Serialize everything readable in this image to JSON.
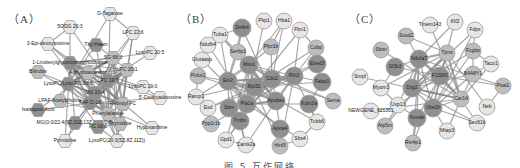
{
  "figure": {
    "caption": "图 5   互作网络"
  },
  "colors": {
    "edge": "#8a8a8a",
    "node_light": "#e6e6e6",
    "node_mid": "#bdbdbd",
    "node_dark": "#8f8f8f",
    "node_stroke": "#9a9a9a",
    "label": "#222222"
  },
  "panels": [
    {
      "id": "A",
      "label": "（A）",
      "node_shape": "hexagon",
      "nodes": [
        {
          "name": "D-Tagatose",
          "x": 110,
          "y": 14,
          "shade": "light"
        },
        {
          "name": "5ODG 20:3",
          "x": 70,
          "y": 27,
          "shade": "light"
        },
        {
          "name": "LPC 22:6",
          "x": 133,
          "y": 33,
          "shade": "light"
        },
        {
          "name": "3-Epi-deoxyinosine",
          "x": 48,
          "y": 44,
          "shade": "light"
        },
        {
          "name": "Thy-Haem",
          "x": 96,
          "y": 45,
          "shade": "dark"
        },
        {
          "name": "LysoPC 20:5",
          "x": 150,
          "y": 53,
          "shade": "light"
        },
        {
          "name": "SG 66:3",
          "x": 113,
          "y": 58,
          "shade": "mid"
        },
        {
          "name": "1-Linoleoylglycerophosphocholine",
          "x": 70,
          "y": 63,
          "shade": "dark"
        },
        {
          "name": "Bilirubin",
          "x": 38,
          "y": 72,
          "shade": "mid"
        },
        {
          "name": "Anhydroaxanthin",
          "x": 88,
          "y": 73,
          "shade": "mid"
        },
        {
          "name": "LPC 20:1",
          "x": 127,
          "y": 70,
          "shade": "mid"
        },
        {
          "name": "LPC 19:0",
          "x": 108,
          "y": 81,
          "shade": "dark"
        },
        {
          "name": "LysoPC/Lyso PC 20:0",
          "x": 68,
          "y": 84,
          "shade": "dark"
        },
        {
          "name": "LysoPC 19:0",
          "x": 143,
          "y": 87,
          "shade": "light"
        },
        {
          "name": "MG 20:4",
          "x": 95,
          "y": 93,
          "shade": "dark"
        },
        {
          "name": "5'-Deoxyadenosine",
          "x": 160,
          "y": 98,
          "shade": "light"
        },
        {
          "name": "LPAF-Acetylcholine",
          "x": 60,
          "y": 101,
          "shade": "mid"
        },
        {
          "name": "PAF C-16",
          "x": 90,
          "y": 103,
          "shade": "dark"
        },
        {
          "name": "Retinoyl PC",
          "x": 123,
          "y": 104,
          "shade": "mid"
        },
        {
          "name": "Isatropoic Acid",
          "x": 38,
          "y": 110,
          "shade": "dark"
        },
        {
          "name": "Phenylalanine",
          "x": 108,
          "y": 114,
          "shade": "mid"
        },
        {
          "name": "MG(0:0/22:4(7Z,10Z,13Z,16Z)/0:0)",
          "x": 75,
          "y": 123,
          "shade": "dark"
        },
        {
          "name": "Thymidine",
          "x": 120,
          "y": 124,
          "shade": "mid"
        },
        {
          "name": "Hypoxanthine",
          "x": 152,
          "y": 128,
          "shade": "light"
        },
        {
          "name": "PC 16:0",
          "x": 98,
          "y": 127,
          "shade": "dark"
        },
        {
          "name": "Pyrroidine",
          "x": 65,
          "y": 141,
          "shade": "light"
        },
        {
          "name": "LysoPC(20:3(5Z,8Z,11Z))",
          "x": 117,
          "y": 141,
          "shade": "light"
        }
      ]
    },
    {
      "id": "B",
      "label": "（B）",
      "node_shape": "circle",
      "nodes": [
        {
          "name": "Defb4",
          "x": 70,
          "y": 28,
          "shade": "dark"
        },
        {
          "name": "Pkp1",
          "x": 92,
          "y": 21,
          "shade": "light"
        },
        {
          "name": "Hba1",
          "x": 112,
          "y": 21,
          "shade": "light"
        },
        {
          "name": "Fbn1",
          "x": 128,
          "y": 30,
          "shade": "light"
        },
        {
          "name": "Tuba1",
          "x": 48,
          "y": 35,
          "shade": "light"
        },
        {
          "name": "Ndufb4",
          "x": 36,
          "y": 45,
          "shade": "light"
        },
        {
          "name": "Pfpr1b",
          "x": 99,
          "y": 47,
          "shade": "mid"
        },
        {
          "name": "Cobp",
          "x": 144,
          "y": 48,
          "shade": "mid"
        },
        {
          "name": "Serbp1",
          "x": 66,
          "y": 52,
          "shade": "mid"
        },
        {
          "name": "Glutaasp",
          "x": 30,
          "y": 60,
          "shade": "light"
        },
        {
          "name": "Msx1",
          "x": 77,
          "y": 65,
          "shade": "dark"
        },
        {
          "name": "Ebed3",
          "x": 145,
          "y": 64,
          "shade": "dark"
        },
        {
          "name": "Pofut1",
          "x": 26,
          "y": 76,
          "shade": "mid"
        },
        {
          "name": "Rln3",
          "x": 122,
          "y": 76,
          "shade": "dark"
        },
        {
          "name": "Cdx2",
          "x": 100,
          "y": 79,
          "shade": "dark"
        },
        {
          "name": "Fabp3",
          "x": 150,
          "y": 82,
          "shade": "dark"
        },
        {
          "name": "Etv2",
          "x": 56,
          "y": 81,
          "shade": "dark"
        },
        {
          "name": "Rpl32",
          "x": 82,
          "y": 87,
          "shade": "dark"
        },
        {
          "name": "Ramp1",
          "x": 24,
          "y": 97,
          "shade": "light"
        },
        {
          "name": "Pla1a",
          "x": 75,
          "y": 104,
          "shade": "dark"
        },
        {
          "name": "Apobec",
          "x": 104,
          "y": 101,
          "shade": "dark"
        },
        {
          "name": "Kdm2a",
          "x": 137,
          "y": 104,
          "shade": "dark"
        },
        {
          "name": "Sema",
          "x": 161,
          "y": 101,
          "shade": "mid"
        },
        {
          "name": "Esd",
          "x": 36,
          "y": 108,
          "shade": "light"
        },
        {
          "name": "Stim",
          "x": 57,
          "y": 108,
          "shade": "dark"
        },
        {
          "name": "Ppp1r1b",
          "x": 39,
          "y": 124,
          "shade": "mid"
        },
        {
          "name": "Tmbn",
          "x": 68,
          "y": 121,
          "shade": "dark"
        },
        {
          "name": "Tubb6",
          "x": 145,
          "y": 122,
          "shade": "light"
        },
        {
          "name": "Apoa4",
          "x": 108,
          "y": 129,
          "shade": "dark"
        },
        {
          "name": "Sbs4",
          "x": 128,
          "y": 139,
          "shade": "light"
        },
        {
          "name": "Gpd1",
          "x": 54,
          "y": 140,
          "shade": "light"
        },
        {
          "name": "Hinf3",
          "x": 108,
          "y": 146,
          "shade": "mid"
        },
        {
          "name": "Camk2a",
          "x": 74,
          "y": 145,
          "shade": "light"
        }
      ]
    },
    {
      "id": "C",
      "label": "（C）",
      "node_shape": "circle",
      "nodes": [
        {
          "name": "Tmem143",
          "x": 87,
          "y": 25,
          "shade": "light"
        },
        {
          "name": "Klf2",
          "x": 112,
          "y": 22,
          "shade": "light"
        },
        {
          "name": "Fdps",
          "x": 132,
          "y": 30,
          "shade": "light"
        },
        {
          "name": "Susd2",
          "x": 63,
          "y": 36,
          "shade": "mid"
        },
        {
          "name": "Sbsn",
          "x": 38,
          "y": 50,
          "shade": "mid"
        },
        {
          "name": "Tpmt",
          "x": 104,
          "y": 53,
          "shade": "mid"
        },
        {
          "name": "Fcgbp",
          "x": 130,
          "y": 51,
          "shade": "mid"
        },
        {
          "name": "Ndufa7",
          "x": 76,
          "y": 59,
          "shade": "dark"
        },
        {
          "name": "Taco1",
          "x": 148,
          "y": 64,
          "shade": "light"
        },
        {
          "name": "Sf3b3",
          "x": 52,
          "y": 67,
          "shade": "dark"
        },
        {
          "name": "B4A8Y1",
          "x": 130,
          "y": 74,
          "shade": "mid"
        },
        {
          "name": "F1SM0",
          "x": 97,
          "y": 76,
          "shade": "dark"
        },
        {
          "name": "Snrpf",
          "x": 17,
          "y": 77,
          "shade": "light"
        },
        {
          "name": "Psat1",
          "x": 160,
          "y": 86,
          "shade": "mid"
        },
        {
          "name": "Drg2",
          "x": 69,
          "y": 88,
          "shade": "dark"
        },
        {
          "name": "Myom3",
          "x": 38,
          "y": 88,
          "shade": "light"
        },
        {
          "name": "Car14",
          "x": 118,
          "y": 99,
          "shade": "mid"
        },
        {
          "name": "Usp13",
          "x": 55,
          "y": 105,
          "shade": "light"
        },
        {
          "name": "Ube2h",
          "x": 90,
          "y": 108,
          "shade": "dark"
        },
        {
          "name": "Neb",
          "x": 144,
          "y": 107,
          "shade": "light"
        },
        {
          "name": "NEWGENE_621361",
          "x": 28,
          "y": 111,
          "shade": "light"
        },
        {
          "name": "Nxnde",
          "x": 74,
          "y": 118,
          "shade": "dark"
        },
        {
          "name": "Sec61b",
          "x": 134,
          "y": 123,
          "shade": "light"
        },
        {
          "name": "Atp5m",
          "x": 42,
          "y": 126,
          "shade": "mid"
        },
        {
          "name": "Mtap3",
          "x": 104,
          "y": 131,
          "shade": "light"
        },
        {
          "name": "Rin4p1",
          "x": 70,
          "y": 143,
          "shade": "mid"
        }
      ]
    }
  ]
}
